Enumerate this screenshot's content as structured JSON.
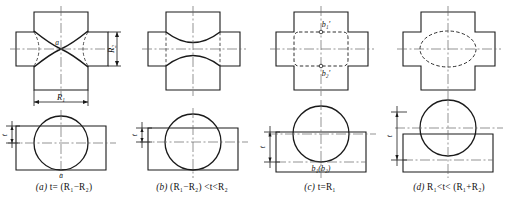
{
  "sheet": {
    "title": "Intersection of cylinder and cross-shaped prism - four cases",
    "stroke_color": "#1a1a1a",
    "centerline_color": "#555555",
    "background": "#ffffff"
  },
  "figures": [
    {
      "key": "a",
      "tag": "(a)",
      "caption": "t= (R₁−R₂)",
      "caption_parts": {
        "tag": "(a)",
        "lhs": "t",
        "rel": "=",
        "rhs": "(R₁−R₂)"
      },
      "top_view": {
        "name": "cross-plate-top-view-a",
        "labels": [
          {
            "name": "point-label-a",
            "text": "a"
          }
        ],
        "dimensions": [
          {
            "name": "dimension-r1",
            "text": "R₁",
            "orientation": "horizontal"
          },
          {
            "name": "dimension-r2",
            "text": "R₂",
            "orientation": "vertical"
          }
        ],
        "curve_type": "crossing-hyperbolic-curves"
      },
      "bottom_view": {
        "name": "circle-rect-bottom-view-a",
        "labels": [
          {
            "name": "point-label-a",
            "text": "a"
          }
        ],
        "dimensions": [
          {
            "name": "dimension-t",
            "text": "t",
            "orientation": "vertical"
          }
        ]
      }
    },
    {
      "key": "b",
      "tag": "(b)",
      "caption": "(R₁−R₂) <t<R₂",
      "caption_parts": {
        "tag": "(b)",
        "lhs": "(R₁−R₂)",
        "rel": "<t<",
        "rhs": "R₂"
      },
      "top_view": {
        "name": "cross-plate-top-view-b",
        "labels": [],
        "dimensions": [],
        "curve_type": "two-concave-curves"
      },
      "bottom_view": {
        "name": "circle-rect-bottom-view-b",
        "labels": [],
        "dimensions": [
          {
            "name": "dimension-t",
            "text": "t",
            "orientation": "vertical"
          }
        ]
      }
    },
    {
      "key": "c",
      "tag": "(c)",
      "caption": "t=R₁",
      "caption_parts": {
        "tag": "(c)",
        "lhs": "t",
        "rel": "=",
        "rhs": "R₁"
      },
      "top_view": {
        "name": "cross-plate-top-view-c",
        "labels": [
          {
            "name": "point-label-b1-prime",
            "text": "b₁′"
          },
          {
            "name": "point-label-b2-prime",
            "text": "b₂′"
          }
        ],
        "dimensions": [],
        "curve_type": "dashed-rounded-square"
      },
      "bottom_view": {
        "name": "circle-rect-bottom-view-c",
        "labels": [
          {
            "name": "point-label-b1-b2",
            "text": "b₁(b₂)"
          }
        ],
        "dimensions": [
          {
            "name": "dimension-t",
            "text": "t",
            "orientation": "vertical"
          }
        ]
      }
    },
    {
      "key": "d",
      "tag": "(d)",
      "caption": "R₁<t< (R₁+R₂)",
      "caption_parts": {
        "tag": "(d)",
        "lhs": "R₁",
        "rel": "<t<",
        "rhs": "(R₁+R₂)"
      },
      "top_view": {
        "name": "cross-plate-top-view-d",
        "labels": [],
        "dimensions": [],
        "curve_type": "dashed-ellipse"
      },
      "bottom_view": {
        "name": "circle-rect-bottom-view-d",
        "labels": [],
        "dimensions": [
          {
            "name": "dimension-t",
            "text": "t",
            "orientation": "vertical"
          }
        ]
      }
    }
  ]
}
